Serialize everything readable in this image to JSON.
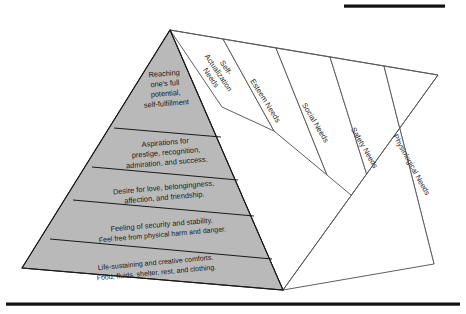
{
  "figure": {
    "colors": {
      "front_face_gray": "#b9b9b9",
      "side_face_white": "#ffffff",
      "line_dark": "#1a1a1a",
      "line_light": "#5f5f5f",
      "rule_black": "#111111",
      "page_background": "#ffffff"
    },
    "rules": {
      "top_rule_label": "",
      "bottom_rule_label": ""
    }
  },
  "pyramid": {
    "tiers": [
      {
        "level": 5,
        "side_label": "Self-Actualization Needs",
        "side_label_lines": [
          "Self-",
          "Actualization",
          "Needs"
        ],
        "front_lines": [
          "Reaching",
          "one's full",
          "potential,",
          "self-fulfillment"
        ]
      },
      {
        "level": 4,
        "side_label": "Esteem Needs",
        "side_label_lines": [
          "Esteem Needs"
        ],
        "front_lines": [
          "Aspirations for",
          "prestige, recognition,",
          "admiration, and success."
        ]
      },
      {
        "level": 3,
        "side_label": "Social Needs",
        "side_label_lines": [
          "Social Needs"
        ],
        "front_lines": [
          "Desire for love, belongingness,",
          "affection, and friendship."
        ]
      },
      {
        "level": 2,
        "side_label": "Safety Needs",
        "side_label_lines": [
          "Safety Needs"
        ],
        "front_lines": [
          "Feeling of security and stability.",
          "Feel free from physical harm and danger."
        ]
      },
      {
        "level": 1,
        "side_label": "Physiological Needs",
        "side_label_lines": [
          "Physiological Needs"
        ],
        "front_lines": [
          "Life-sustaining and creative comforts.",
          "Food, fluids, shelter, rest, and clothing."
        ]
      }
    ]
  }
}
